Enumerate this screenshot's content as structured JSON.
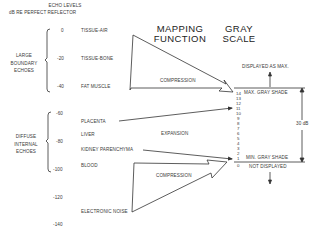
{
  "header": {
    "echo_levels_title": "ECHO LEVELS",
    "echo_levels_subtitle": "dB RE PERFECT REFLECTOR",
    "mapping_function_line1": "MAPPING",
    "mapping_function_line2": "FUNCTION",
    "gray_scale_line1": "GRAY",
    "gray_scale_line2": "SCALE"
  },
  "groups": {
    "large_boundary": [
      "LARGE",
      "BOUNDARY",
      "ECHOES"
    ],
    "diffuse_internal": [
      "DIFFUSE",
      "INTERNAL",
      "ECHOES"
    ]
  },
  "db_scale": [
    "0",
    "-20",
    "-40",
    "-60",
    "-80",
    "-100",
    "-120",
    "-140"
  ],
  "tissues": [
    {
      "label": "TISSUE-AIR"
    },
    {
      "label": "TISSUE-BONE"
    },
    {
      "label": "FAT MUSCLE"
    },
    {
      "label": "PLACENTA"
    },
    {
      "label": "LIVER"
    },
    {
      "label": "KIDNEY PARENCHYMA"
    },
    {
      "label": "BLOOD"
    },
    {
      "label": "ELECTRONIC NOISE"
    }
  ],
  "mapping": {
    "compression_top": "COMPRESSION",
    "expansion": "EXPANSION",
    "compression_bottom": "COMPRESSION"
  },
  "gray_scale": {
    "levels": [
      "14",
      "13",
      "12",
      "11",
      "10",
      "9",
      "8",
      "7",
      "6",
      "5",
      "4",
      "3",
      "2",
      "1",
      "0"
    ],
    "displayed_as_max": "DISPLAYED AS MAX.",
    "max_gray_shade": "MAX. GRAY SHADE",
    "min_gray_shade": "MIN. GRAY SHADE",
    "not_displayed": "NOT DISPLAYED",
    "range": "30 dB"
  },
  "colors": {
    "line": "#333333",
    "text": "#3a3a3a"
  }
}
